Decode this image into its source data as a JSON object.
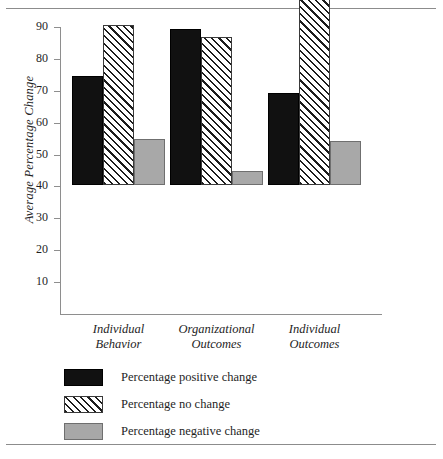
{
  "chart_data": {
    "type": "bar",
    "title": "",
    "subtitle": "",
    "xlabel": "",
    "ylabel": "Average Percentage Change",
    "ylim": [
      0,
      90
    ],
    "yticks": [
      10,
      20,
      30,
      40,
      50,
      60,
      70,
      80,
      90
    ],
    "ytick_labels": [
      "10",
      "20",
      "30",
      "40",
      "50",
      "60",
      "70",
      "80",
      "90"
    ],
    "grid": false,
    "legend_position": "below-plot-left",
    "categories": [
      "Individual Behavior",
      "Organizational Outcomes",
      "Individual Outcomes"
    ],
    "category_lines": [
      [
        "Individual",
        "Behavior"
      ],
      [
        "Organizational",
        "Outcomes"
      ],
      [
        "Individual",
        "Outcomes"
      ]
    ],
    "series": [
      {
        "name": "Percentage positive change",
        "fill": "solid-black",
        "color": "#111111",
        "values": [
          34.3,
          48.8,
          28.8
        ]
      },
      {
        "name": "Percentage no change",
        "fill": "diagonal-hatch",
        "color": "#ffffff",
        "values": [
          50.2,
          46.4,
          58.4
        ]
      },
      {
        "name": "Percentage negative change",
        "fill": "solid-gray",
        "color": "#a8a8a8",
        "values": [
          14.4,
          4.5,
          13.7
        ]
      }
    ]
  },
  "axis": {
    "y_title": "Average Percentage Change"
  },
  "legend": {
    "items": [
      {
        "label": "Percentage positive change",
        "swatch": "black-swatch"
      },
      {
        "label": "Percentage no change",
        "swatch": "hatched-swatch"
      },
      {
        "label": "Percentage negative change",
        "swatch": "gray-swatch"
      }
    ]
  }
}
